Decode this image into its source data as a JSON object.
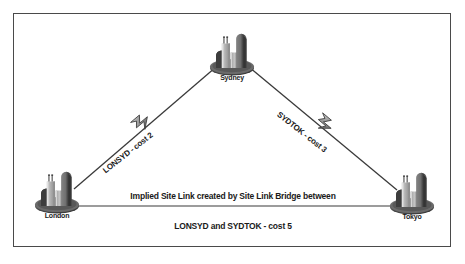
{
  "figure": {
    "background": "#ffffff",
    "frame_color": "#4a4a4a"
  },
  "nodes": [
    {
      "id": "sydney",
      "label": "Sydney",
      "x": 232,
      "y": 58,
      "label_x": 232,
      "label_y": 78
    },
    {
      "id": "london",
      "label": "London",
      "x": 57,
      "y": 196,
      "label_x": 57,
      "label_y": 216
    },
    {
      "id": "tokyo",
      "label": "Tokyo",
      "x": 412,
      "y": 197,
      "label_x": 412,
      "label_y": 217
    }
  ],
  "links": [
    {
      "id": "lonsyd",
      "label": "LONSYD - cost 2",
      "from": "london",
      "to": "sydney",
      "cost": 2,
      "has_bolt": true,
      "label_x": 104,
      "label_y": 167,
      "rotation": -38
    },
    {
      "id": "sydtok",
      "label": "SYDTOK - cost 3",
      "from": "sydney",
      "to": "tokyo",
      "cost": 3,
      "has_bolt": true,
      "label_x": 278,
      "label_y": 109,
      "rotation": 38
    },
    {
      "id": "implied",
      "label_line1": "Implied Site Link created by Site Link Bridge between",
      "label_line2": "LONSYD and SYDTOK - cost 5",
      "from": "london",
      "to": "tokyo",
      "cost": 5,
      "has_bolt": false,
      "label_x": 233,
      "label_y1": 191,
      "label_y2": 221
    }
  ],
  "icons": {
    "site": "site-building-icon",
    "bolt": "lightning-bolt-icon"
  },
  "colors": {
    "line": "#3a3a3a",
    "text": "#1a1a1a",
    "building_dark": "#6e6e6e",
    "building_light": "#b8b8b8",
    "base": "#4f4f4f"
  }
}
